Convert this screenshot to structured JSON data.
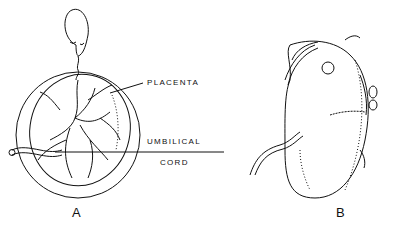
{
  "figure": {
    "panels": [
      {
        "id": "A",
        "label": "A",
        "description": "Opened ovum with embryo attached, placenta villi and umbilical cord"
      },
      {
        "id": "B",
        "label": "B",
        "description": "Exterior of ovum/chorion with umbilical cord"
      }
    ],
    "annotations": {
      "placenta": "PLACENTA",
      "umbilical": "UMBILICAL",
      "cord": "CORD"
    },
    "colors": {
      "ink": "#111111",
      "background": "#ffffff"
    }
  }
}
